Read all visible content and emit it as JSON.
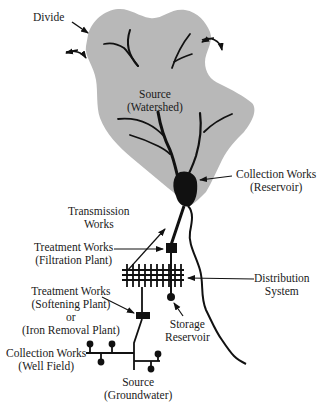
{
  "diagram": {
    "type": "water supply system schematic",
    "colors": {
      "watershed_fill": "#b8b8b8",
      "ink": "#111111",
      "background": "#ffffff"
    },
    "labels": {
      "divide": {
        "line1": "Divide"
      },
      "source_watershed": {
        "line1": "Source",
        "line2": "(Watershed)"
      },
      "collection_reservoir": {
        "line1": "Collection Works",
        "line2": "(Reservoir)"
      },
      "transmission": {
        "line1": "Transmission",
        "line2": "Works"
      },
      "treatment_filtration": {
        "line1": "Treatment Works",
        "line2": "(Filtration Plant)"
      },
      "distribution": {
        "line1": "Distribution",
        "line2": "System"
      },
      "treatment_softening": {
        "line1": "Treatment Works",
        "line2": "(Softening Plant)",
        "line3": "or",
        "line4": "(Iron Removal Plant)"
      },
      "storage": {
        "line1": "Storage",
        "line2": "Reservoir"
      },
      "collection_wellfield": {
        "line1": "Collection Works",
        "line2": "(Well Field)"
      },
      "source_groundwater": {
        "line1": "Source",
        "line2": "(Groundwater)"
      }
    }
  }
}
